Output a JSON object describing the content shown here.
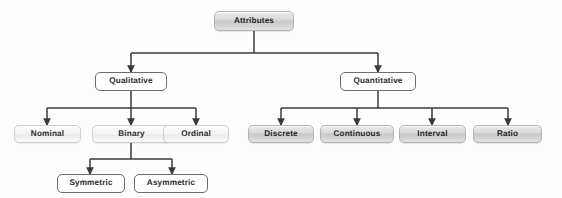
{
  "diagram": {
    "type": "hierarchy-tree",
    "orientation": "top-down",
    "background_color": "#fdfdfd",
    "edge_color": "#3a3a3a",
    "styles": {
      "shaded_fill": "#d2d2d2",
      "shaded_border": "#b4b4b4",
      "light_fill": "#f2f2f2",
      "light_border": "#cfcfcf",
      "plain_fill": "#ffffff",
      "plain_border": "#6d6d6d",
      "text_color": "#2a2a2a"
    }
  },
  "nodes": {
    "root": {
      "label": "Attributes",
      "level": 0,
      "style": "shaded"
    },
    "qualitative": {
      "label": "Qualitative",
      "level": 1,
      "style": "plain"
    },
    "quantitative": {
      "label": "Quantitative",
      "level": 1,
      "style": "plain"
    },
    "nominal": {
      "label": "Nominal",
      "level": 2,
      "style": "light"
    },
    "binary": {
      "label": "Binary",
      "level": 2,
      "style": "light"
    },
    "ordinal": {
      "label": "Ordinal",
      "level": 2,
      "style": "light"
    },
    "discrete": {
      "label": "Discrete",
      "level": 2,
      "style": "shaded"
    },
    "continuous": {
      "label": "Continuous",
      "level": 2,
      "style": "shaded"
    },
    "interval": {
      "label": "Interval",
      "level": 2,
      "style": "shaded"
    },
    "ratio": {
      "label": "Ratio",
      "level": 2,
      "style": "shaded"
    },
    "symmetric": {
      "label": "Symmetric",
      "level": 3,
      "style": "plain"
    },
    "asymmetric": {
      "label": "Asymmetric",
      "level": 3,
      "style": "plain"
    }
  },
  "edges": [
    {
      "from": "root",
      "to": "qualitative"
    },
    {
      "from": "root",
      "to": "quantitative"
    },
    {
      "from": "qualitative",
      "to": "nominal"
    },
    {
      "from": "qualitative",
      "to": "binary"
    },
    {
      "from": "qualitative",
      "to": "ordinal"
    },
    {
      "from": "quantitative",
      "to": "discrete"
    },
    {
      "from": "quantitative",
      "to": "continuous"
    },
    {
      "from": "quantitative",
      "to": "interval"
    },
    {
      "from": "quantitative",
      "to": "ratio"
    },
    {
      "from": "binary",
      "to": "symmetric"
    },
    {
      "from": "binary",
      "to": "asymmetric"
    }
  ]
}
